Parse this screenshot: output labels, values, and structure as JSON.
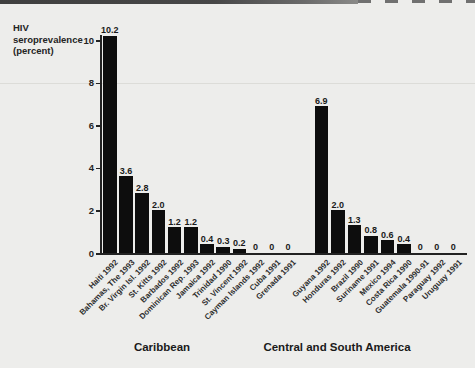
{
  "chart_data": {
    "type": "bar",
    "title": "",
    "ylabel_lines": [
      "HIV",
      "seroprevalence",
      "(percent)"
    ],
    "ylim": [
      0,
      10
    ],
    "yticks": [
      0,
      2,
      4,
      6,
      8,
      10
    ],
    "grid": false,
    "legend": "none",
    "bar_color": "#0d0d0d",
    "background_color": "#ededeb",
    "groups": [
      {
        "label": "Caribbean",
        "categories": [
          "Haiti 1992",
          "Bahamas, The 1993",
          "Br. Virgin Isl. 1992",
          "St. Kitts 1992",
          "Barbados 1992",
          "Dominican Rep. 1993",
          "Jamaica 1992",
          "Trinidad 1990",
          "St. Vincent 1992",
          "Cayman Islands 1992",
          "Cuba 1991",
          "Grenada 1991"
        ],
        "values": [
          10.2,
          3.6,
          2.8,
          2.0,
          1.2,
          1.2,
          0.4,
          0.3,
          0.2,
          0,
          0,
          0
        ],
        "value_labels": [
          "10.2",
          "3.6",
          "2.8",
          "2.0",
          "1.2",
          "1.2",
          "0.4",
          "0.3",
          "0.2",
          "0",
          "0",
          "0"
        ]
      },
      {
        "label": "Central and South America",
        "categories": [
          "Guyana 1992",
          "Honduras 1992",
          "Brazil 1990",
          "Suriname 1991",
          "Mexico 1994",
          "Costa Rica 1990",
          "Guatemala 1990-91",
          "Paraguay 1992",
          "Uruguay 1991"
        ],
        "values": [
          6.9,
          2.0,
          1.3,
          0.8,
          0.6,
          0.4,
          0,
          0,
          0
        ],
        "value_labels": [
          "6.9",
          "2.0",
          "1.3",
          "0.8",
          "0.6",
          "0.4",
          "0",
          "0",
          "0"
        ]
      }
    ]
  }
}
